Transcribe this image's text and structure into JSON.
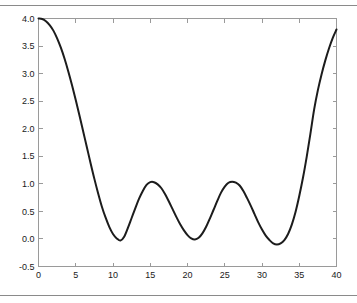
{
  "figure": {
    "background_color": "#ffffff",
    "border_color": "#8a8a8a",
    "axis_color": "#9a9a9a",
    "curve_color": "#1c1c1c"
  },
  "chart_data": {
    "type": "line",
    "title": "",
    "subtitle": "",
    "xlabel": "",
    "ylabel": "",
    "xlim": [
      0,
      40
    ],
    "ylim": [
      -0.5,
      4.0
    ],
    "grid": false,
    "legend": null,
    "legend_position": "none",
    "xticks": [
      0,
      5,
      10,
      15,
      20,
      25,
      30,
      35,
      40
    ],
    "xticklabels": [
      "0",
      "5",
      "10",
      "15",
      "20",
      "25",
      "30",
      "35",
      "40"
    ],
    "yticks": [
      -0.5,
      0.0,
      0.5,
      1.0,
      1.5,
      2.0,
      2.5,
      3.0,
      3.5,
      4.0
    ],
    "yticklabels": [
      "-0.5",
      "0.0",
      "0.5",
      "1.0",
      "1.5",
      "2.0",
      "2.5",
      "3.0",
      "3.5",
      "4.0"
    ],
    "annotations": [],
    "series": [
      {
        "name": "curve",
        "color": "#1c1c1c",
        "linewidth": 2,
        "x": [
          0,
          0.5,
          1,
          1.5,
          2,
          2.5,
          3,
          3.5,
          4,
          4.5,
          5,
          5.5,
          6,
          6.5,
          7,
          7.5,
          8,
          8.5,
          9,
          9.5,
          10,
          10.5,
          11,
          11.5,
          12,
          12.5,
          13,
          13.5,
          14,
          14.5,
          15,
          15.5,
          16,
          16.5,
          17,
          17.5,
          18,
          18.5,
          19,
          19.5,
          20,
          20.5,
          21,
          21.5,
          22,
          22.5,
          23,
          23.5,
          24,
          24.5,
          25,
          25.5,
          26,
          26.5,
          27,
          27.5,
          28,
          28.5,
          29,
          29.5,
          30,
          30.5,
          31,
          31.5,
          32,
          32.5,
          33,
          33.5,
          34,
          34.5,
          35,
          35.5,
          36,
          36.5,
          37,
          37.5,
          38,
          38.5,
          39,
          39.5,
          40
        ],
        "y": [
          4.0,
          3.99,
          3.95,
          3.88,
          3.78,
          3.64,
          3.47,
          3.27,
          3.04,
          2.79,
          2.52,
          2.24,
          1.95,
          1.66,
          1.37,
          1.09,
          0.83,
          0.59,
          0.39,
          0.22,
          0.09,
          0.01,
          -0.03,
          0.04,
          0.2,
          0.38,
          0.56,
          0.73,
          0.87,
          0.98,
          1.03,
          1.03,
          0.99,
          0.92,
          0.81,
          0.68,
          0.54,
          0.4,
          0.27,
          0.16,
          0.07,
          0.01,
          -0.01,
          0.02,
          0.1,
          0.22,
          0.37,
          0.53,
          0.69,
          0.84,
          0.95,
          1.02,
          1.04,
          1.02,
          0.97,
          0.87,
          0.74,
          0.6,
          0.45,
          0.3,
          0.17,
          0.06,
          -0.02,
          -0.08,
          -0.1,
          -0.08,
          -0.02,
          0.09,
          0.26,
          0.49,
          0.78,
          1.11,
          1.49,
          1.91,
          2.35,
          2.7,
          2.99,
          3.24,
          3.46,
          3.65,
          3.8
        ]
      }
    ]
  }
}
